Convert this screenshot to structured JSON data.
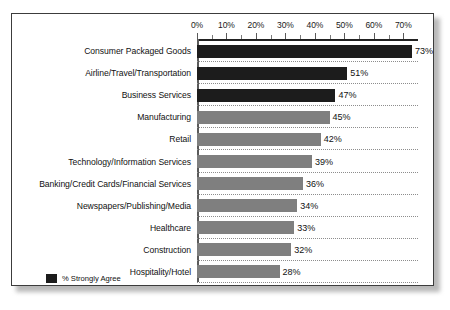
{
  "chart_data": {
    "type": "bar",
    "orientation": "horizontal",
    "title": "",
    "xlabel": "",
    "ylabel": "",
    "xlim": [
      0,
      75
    ],
    "xticks": [
      "0%",
      "10%",
      "20%",
      "30%",
      "40%",
      "50%",
      "60%",
      "70%"
    ],
    "xtick_values": [
      0,
      10,
      20,
      30,
      40,
      50,
      60,
      70
    ],
    "minor_tick_step": 5,
    "grid": false,
    "separators": "dotted",
    "legend": {
      "position": "bottom-left",
      "entries": [
        {
          "label": "% Strongly Agree",
          "color": "#1c1c1c"
        }
      ]
    },
    "categories": [
      "Consumer Packaged Goods",
      "Airline/Travel/Transportation",
      "Business Services",
      "Manufacturing",
      "Retail",
      "Technology/Information Services",
      "Banking/Credit Cards/Financial Services",
      "Newspapers/Publishing/Media",
      "Healthcare",
      "Construction",
      "Hospitality/Hotel"
    ],
    "values": [
      73,
      51,
      47,
      45,
      42,
      39,
      36,
      34,
      33,
      32,
      28
    ],
    "value_labels": [
      "73%",
      "51%",
      "47%",
      "45%",
      "42%",
      "39%",
      "36%",
      "34%",
      "33%",
      "32%",
      "28%"
    ],
    "bar_colors": [
      "#1c1c1c",
      "#1c1c1c",
      "#1c1c1c",
      "#7f7f7f",
      "#7f7f7f",
      "#7f7f7f",
      "#7f7f7f",
      "#7f7f7f",
      "#7f7f7f",
      "#7f7f7f",
      "#7f7f7f"
    ],
    "colors": {
      "dark": "#1c1c1c",
      "gray": "#7f7f7f",
      "frame": "#3c3c3c",
      "axis": "#222222",
      "separator": "#8d8d8d",
      "background": "#ffffff"
    }
  }
}
